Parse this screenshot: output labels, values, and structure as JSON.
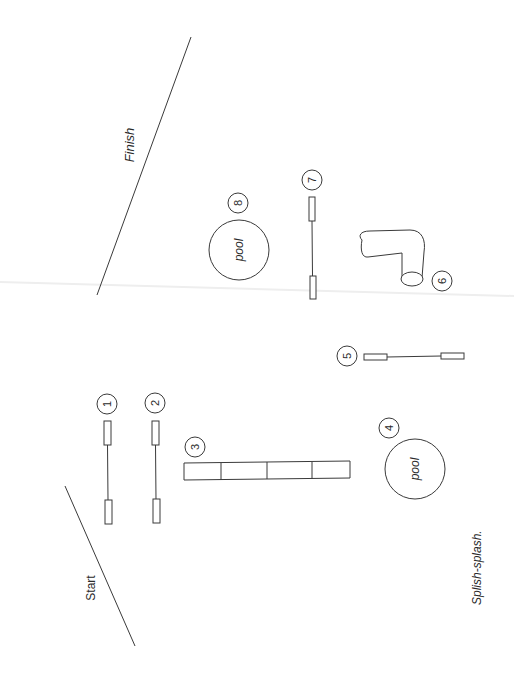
{
  "diagram": {
    "caption": "Splish-splash.",
    "start_label": "Start",
    "finish_label": "Finish",
    "colors": {
      "line": "#3a3a3a",
      "text": "#2a2a2a",
      "background": "#ffffff"
    },
    "obstacles": [
      {
        "number": "1",
        "type": "jump"
      },
      {
        "number": "2",
        "type": "jump"
      },
      {
        "number": "3",
        "type": "tunnel-segments"
      },
      {
        "number": "4",
        "type": "pool",
        "label": "pool"
      },
      {
        "number": "5",
        "type": "jump"
      },
      {
        "number": "6",
        "type": "curved-tunnel"
      },
      {
        "number": "7",
        "type": "jump"
      },
      {
        "number": "8",
        "type": "pool",
        "label": "pool"
      }
    ]
  }
}
